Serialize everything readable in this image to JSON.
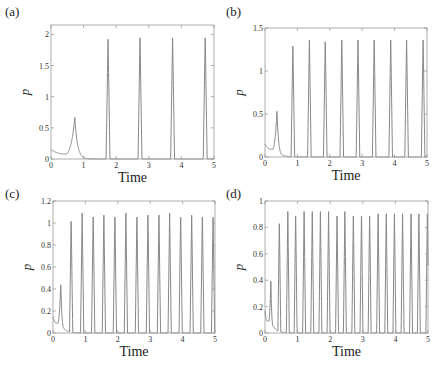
{
  "figure": {
    "panels": [
      {
        "label": "(a)",
        "xlabel": "Time",
        "ylabel": "p"
      },
      {
        "label": "(b)",
        "xlabel": "Time",
        "ylabel": "p"
      },
      {
        "label": "(c)",
        "xlabel": "Time",
        "ylabel": "p"
      },
      {
        "label": "(d)",
        "xlabel": "Time",
        "ylabel": "p"
      }
    ]
  },
  "chart_data": [
    {
      "type": "line",
      "panel": "(a)",
      "title": "",
      "xlabel": "Time",
      "ylabel": "p",
      "xlim": [
        0,
        5
      ],
      "ylim": [
        0,
        2.15
      ],
      "xticks": [
        "0",
        "1",
        "2",
        "3",
        "4",
        "5"
      ],
      "yticks": [
        "0",
        "0.5",
        "1",
        "1.5",
        "2"
      ],
      "ytick_values": [
        0,
        0.5,
        1,
        1.5,
        2
      ],
      "grid": false,
      "initial": {
        "p0": 0.15,
        "min": 0.08,
        "min_t": 0.4,
        "hump_t": 0.73,
        "hump_p": 0.67
      },
      "spike_times": [
        1.75,
        2.73,
        3.73,
        4.73
      ],
      "spike_heights": [
        1.92,
        1.97,
        1.97,
        1.97
      ],
      "spike_halfwidth": 0.06,
      "color": "#888888"
    },
    {
      "type": "line",
      "panel": "(b)",
      "title": "",
      "xlabel": "Time",
      "ylabel": "p",
      "xlim": [
        0,
        5
      ],
      "ylim": [
        0,
        1.5
      ],
      "xticks": [
        "0",
        "1",
        "2",
        "3",
        "4",
        "5"
      ],
      "yticks": [
        "0",
        "0.5",
        "1",
        "1.5"
      ],
      "ytick_values": [
        0,
        0.5,
        1,
        1.5
      ],
      "grid": false,
      "initial": {
        "p0": 0.15,
        "min": 0.09,
        "min_t": 0.18,
        "hump_t": 0.37,
        "hump_p": 0.54
      },
      "spike_times": [
        0.86,
        1.37,
        1.86,
        2.37,
        2.87,
        3.37,
        3.88,
        4.37,
        4.88
      ],
      "spike_heights": [
        1.33,
        1.38,
        1.38,
        1.38,
        1.38,
        1.38,
        1.38,
        1.38,
        1.38
      ],
      "spike_halfwidth": 0.055,
      "color": "#888888"
    },
    {
      "type": "line",
      "panel": "(c)",
      "title": "",
      "xlabel": "Time",
      "ylabel": "p",
      "xlim": [
        0,
        5
      ],
      "ylim": [
        0,
        1.2
      ],
      "xticks": [
        "0",
        "1",
        "2",
        "3",
        "4",
        "5"
      ],
      "yticks": [
        "0",
        "0.2",
        "0.4",
        "0.6",
        "0.8",
        "1",
        "1.2"
      ],
      "ytick_values": [
        0,
        0.2,
        0.4,
        0.6,
        0.8,
        1,
        1.2
      ],
      "grid": false,
      "initial": {
        "p0": 0.15,
        "min": 0.09,
        "min_t": 0.1,
        "hump_t": 0.24,
        "hump_p": 0.46
      },
      "spike_times": [
        0.56,
        0.9,
        1.24,
        1.57,
        1.91,
        2.25,
        2.59,
        2.93,
        3.27,
        3.6,
        3.94,
        4.28,
        4.61,
        4.94
      ],
      "spike_heights": [
        1.05,
        1.09,
        1.09,
        1.09,
        1.09,
        1.09,
        1.09,
        1.09,
        1.09,
        1.09,
        1.09,
        1.09,
        1.09,
        1.09
      ],
      "spike_halfwidth": 0.05,
      "color": "#888888"
    },
    {
      "type": "line",
      "panel": "(d)",
      "title": "",
      "xlabel": "Time",
      "ylabel": "p",
      "xlim": [
        0,
        5
      ],
      "ylim": [
        0,
        1
      ],
      "xticks": [
        "0",
        "1",
        "2",
        "3",
        "4",
        "5"
      ],
      "yticks": [
        "0",
        "0.2",
        "0.4",
        "0.6",
        "0.8",
        "1"
      ],
      "ytick_values": [
        0,
        0.2,
        0.4,
        0.6,
        0.8,
        1
      ],
      "grid": false,
      "initial": {
        "p0": 0.17,
        "min": 0.09,
        "min_t": 0.07,
        "hump_t": 0.18,
        "hump_p": 0.4
      },
      "spike_times": [
        0.44,
        0.7,
        0.94,
        1.2,
        1.45,
        1.7,
        1.95,
        2.21,
        2.45,
        2.71,
        2.96,
        3.21,
        3.47,
        3.72,
        3.97,
        4.22,
        4.48,
        4.72,
        4.98
      ],
      "spike_heights": [
        0.86,
        0.92,
        0.92,
        0.92,
        0.92,
        0.92,
        0.92,
        0.92,
        0.92,
        0.92,
        0.92,
        0.92,
        0.92,
        0.92,
        0.92,
        0.92,
        0.92,
        0.92,
        0.92
      ],
      "spike_halfwidth": 0.045,
      "color": "#888888"
    }
  ]
}
